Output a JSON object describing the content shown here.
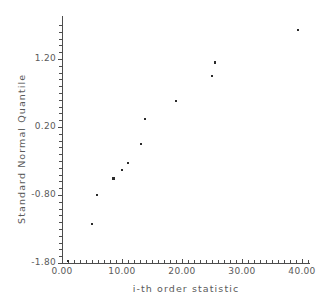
{
  "chart_data": {
    "type": "scatter",
    "title": "",
    "xlabel": "i-th order statistic",
    "ylabel": "Standard Normal Quantile",
    "xlim": [
      0.0,
      40.5
    ],
    "ylim": [
      -1.85,
      1.75
    ],
    "grid": false,
    "legend": null,
    "xticks": [
      "0.00",
      "10.00",
      "20.00",
      "30.00",
      "40.00"
    ],
    "xtick_values": [
      0,
      10,
      20,
      30,
      40
    ],
    "yticks": [
      "1.20",
      "0.20",
      "-0.80",
      "-1.80"
    ],
    "ytick_values": [
      1.2,
      0.2,
      -0.8,
      -1.8
    ],
    "minor_tick_step_x": 1.0,
    "minor_tick_step_y": 0.1,
    "series": [
      {
        "name": "order statistics",
        "marker": "square",
        "color": "#2b2b2b",
        "points": [
          {
            "x": 1.0,
            "y": -1.77
          },
          {
            "x": 5.0,
            "y": -1.23
          },
          {
            "x": 5.8,
            "y": -0.8
          },
          {
            "x": 8.6,
            "y": -0.56
          },
          {
            "x": 10.0,
            "y": -0.43
          },
          {
            "x": 11.0,
            "y": -0.33
          },
          {
            "x": 13.2,
            "y": -0.05
          },
          {
            "x": 13.8,
            "y": 0.32
          },
          {
            "x": 19.0,
            "y": 0.58
          },
          {
            "x": 25.0,
            "y": 0.95
          },
          {
            "x": 25.5,
            "y": 1.15
          },
          {
            "x": 39.3,
            "y": 1.63
          }
        ]
      }
    ]
  },
  "axes": {
    "x_label": "i-th order statistic",
    "y_label": "Standard Normal Quantile"
  },
  "caption": {
    "ghost_text": ""
  }
}
